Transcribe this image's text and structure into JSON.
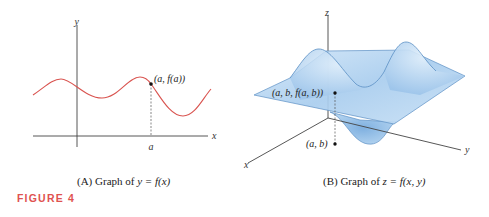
{
  "figure": {
    "label": "FIGURE 4",
    "label_color": "#e0524f"
  },
  "panel_a": {
    "caption_prefix": "(A)  Graph of ",
    "caption_math": "y = f(x)",
    "axis_x_label": "x",
    "axis_y_label": "y",
    "point_label": "(a, f(a))",
    "tick_label": "a",
    "curve_color": "#d9534f"
  },
  "panel_b": {
    "caption_prefix": "(B)  Graph of ",
    "caption_math": "z = f(x, y)",
    "axis_x_label": "x",
    "axis_y_label": "y",
    "axis_z_label": "z",
    "point_label_surface": "(a, b, f(a, b))",
    "point_label_plane": "(a, b)",
    "surface_color": "#a9cdee",
    "surface_edge_color": "#5b8fc4"
  }
}
